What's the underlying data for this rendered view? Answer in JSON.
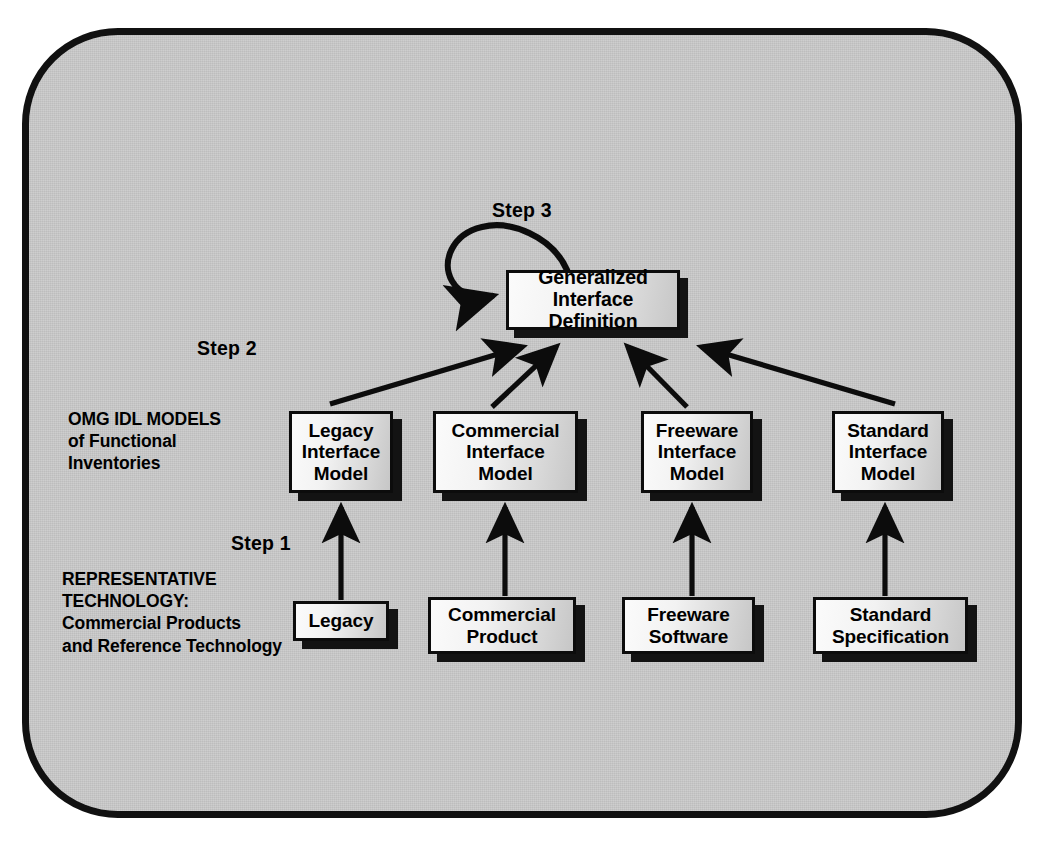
{
  "diagram": {
    "title": "OMG IDL Models of Functional Inventories",
    "frame_color": "#111111",
    "frame_fill": "#c9c9c9",
    "node_border": "#0c0c0c",
    "shadow_color": "#131313",
    "arrow_color": "#0c0c0c"
  },
  "steps": {
    "step1": "Step 1",
    "step2": "Step 2",
    "step3": "Step 3"
  },
  "row_labels": {
    "models": "OMG IDL MODELS\nof Functional\nInventories",
    "technology": "REPRESENTATIVE\nTECHNOLOGY:\nCommercial Products\nand Reference Technology"
  },
  "nodes": {
    "top": {
      "line1": "Generalized",
      "line2": "Interface Definition"
    },
    "models": [
      {
        "line1": "Legacy",
        "line2": "Interface",
        "line3": "Model"
      },
      {
        "line1": "Commercial",
        "line2": "Interface",
        "line3": "Model"
      },
      {
        "line1": "Freeware",
        "line2": "Interface",
        "line3": "Model"
      },
      {
        "line1": "Standard",
        "line2": "Interface",
        "line3": "Model"
      }
    ],
    "technology": [
      {
        "line1": "Legacy",
        "line2": ""
      },
      {
        "line1": "Commercial",
        "line2": "Product"
      },
      {
        "line1": "Freeware",
        "line2": "Software"
      },
      {
        "line1": "Standard",
        "line2": "Specification"
      }
    ]
  }
}
